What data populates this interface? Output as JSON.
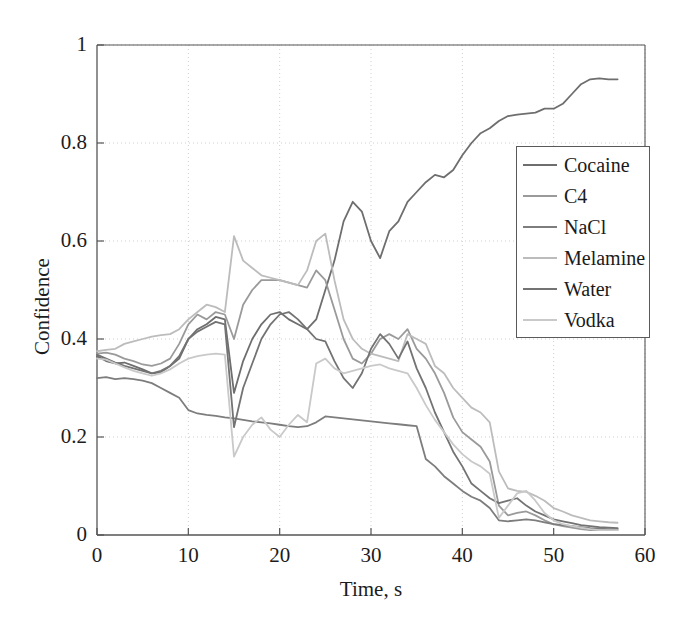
{
  "chart_data": {
    "type": "line",
    "title": "",
    "xlabel": "Time, s",
    "ylabel": "Confidence",
    "xlim": [
      0,
      60
    ],
    "ylim": [
      0,
      1
    ],
    "xticks": [
      "0",
      "10",
      "20",
      "30",
      "40",
      "50",
      "60"
    ],
    "xtick_values": [
      0,
      10,
      20,
      30,
      40,
      50,
      60
    ],
    "yticks": [
      "0",
      "0.2",
      "0.4",
      "0.6",
      "0.8",
      "1"
    ],
    "ytick_values": [
      0,
      0.2,
      0.4,
      0.6,
      0.8,
      1
    ],
    "grid": true,
    "grid_style": "dotted",
    "legend_position": "upper-right-inside",
    "x": [
      0,
      1,
      2,
      3,
      4,
      5,
      6,
      7,
      8,
      9,
      10,
      11,
      12,
      13,
      14,
      15,
      16,
      17,
      18,
      19,
      20,
      21,
      22,
      23,
      24,
      25,
      26,
      27,
      28,
      29,
      30,
      31,
      32,
      33,
      34,
      35,
      36,
      37,
      38,
      39,
      40,
      41,
      42,
      43,
      44,
      45,
      46,
      47,
      48,
      49,
      50,
      51,
      52,
      53,
      54,
      55,
      56,
      57
    ],
    "series": [
      {
        "name": "Cocaine",
        "color": "#6e6e6e",
        "values": [
          0.365,
          0.355,
          0.35,
          0.352,
          0.345,
          0.338,
          0.33,
          0.332,
          0.345,
          0.36,
          0.4,
          0.42,
          0.43,
          0.445,
          0.44,
          0.29,
          0.355,
          0.4,
          0.43,
          0.45,
          0.455,
          0.44,
          0.43,
          0.42,
          0.44,
          0.5,
          0.56,
          0.64,
          0.68,
          0.66,
          0.6,
          0.565,
          0.62,
          0.64,
          0.68,
          0.7,
          0.72,
          0.735,
          0.73,
          0.745,
          0.775,
          0.8,
          0.82,
          0.83,
          0.845,
          0.855,
          0.858,
          0.86,
          0.862,
          0.87,
          0.87,
          0.88,
          0.9,
          0.92,
          0.93,
          0.932,
          0.93,
          0.93
        ]
      },
      {
        "name": "C4",
        "color": "#9a9a9a",
        "values": [
          0.37,
          0.372,
          0.368,
          0.36,
          0.355,
          0.348,
          0.345,
          0.35,
          0.36,
          0.39,
          0.43,
          0.45,
          0.44,
          0.455,
          0.45,
          0.4,
          0.47,
          0.5,
          0.52,
          0.52,
          0.52,
          0.515,
          0.51,
          0.505,
          0.54,
          0.52,
          0.46,
          0.4,
          0.36,
          0.35,
          0.37,
          0.4,
          0.41,
          0.4,
          0.42,
          0.38,
          0.36,
          0.33,
          0.29,
          0.24,
          0.21,
          0.195,
          0.18,
          0.15,
          0.06,
          0.04,
          0.045,
          0.048,
          0.04,
          0.03,
          0.022,
          0.018,
          0.015,
          0.012,
          0.01,
          0.01,
          0.01,
          0.01
        ]
      },
      {
        "name": "NaCl",
        "color": "#7d7d7d",
        "values": [
          0.32,
          0.322,
          0.318,
          0.32,
          0.318,
          0.315,
          0.31,
          0.3,
          0.29,
          0.28,
          0.255,
          0.248,
          0.245,
          0.243,
          0.24,
          0.238,
          0.235,
          0.232,
          0.23,
          0.228,
          0.225,
          0.222,
          0.22,
          0.222,
          0.23,
          0.242,
          0.24,
          0.238,
          0.236,
          0.234,
          0.232,
          0.23,
          0.228,
          0.226,
          0.224,
          0.222,
          0.155,
          0.14,
          0.12,
          0.105,
          0.09,
          0.078,
          0.07,
          0.055,
          0.03,
          0.028,
          0.03,
          0.032,
          0.03,
          0.026,
          0.022,
          0.02,
          0.018,
          0.016,
          0.014,
          0.013,
          0.012,
          0.012
        ]
      },
      {
        "name": "Melamine",
        "color": "#bcbcbc",
        "values": [
          0.375,
          0.378,
          0.38,
          0.39,
          0.395,
          0.4,
          0.405,
          0.408,
          0.41,
          0.42,
          0.44,
          0.455,
          0.47,
          0.465,
          0.455,
          0.61,
          0.56,
          0.545,
          0.53,
          0.525,
          0.52,
          0.515,
          0.51,
          0.54,
          0.6,
          0.615,
          0.52,
          0.44,
          0.4,
          0.38,
          0.37,
          0.365,
          0.36,
          0.355,
          0.41,
          0.4,
          0.39,
          0.345,
          0.33,
          0.3,
          0.28,
          0.26,
          0.25,
          0.23,
          0.13,
          0.095,
          0.09,
          0.088,
          0.08,
          0.07,
          0.055,
          0.048,
          0.04,
          0.035,
          0.03,
          0.028,
          0.026,
          0.025
        ]
      },
      {
        "name": "Water",
        "color": "#737373",
        "values": [
          0.368,
          0.36,
          0.352,
          0.345,
          0.34,
          0.335,
          0.33,
          0.335,
          0.345,
          0.365,
          0.4,
          0.415,
          0.425,
          0.435,
          0.43,
          0.22,
          0.3,
          0.35,
          0.4,
          0.43,
          0.45,
          0.455,
          0.44,
          0.42,
          0.4,
          0.395,
          0.355,
          0.32,
          0.3,
          0.33,
          0.38,
          0.41,
          0.39,
          0.36,
          0.395,
          0.34,
          0.3,
          0.25,
          0.21,
          0.17,
          0.14,
          0.105,
          0.09,
          0.075,
          0.065,
          0.07,
          0.075,
          0.06,
          0.048,
          0.04,
          0.032,
          0.028,
          0.024,
          0.02,
          0.018,
          0.016,
          0.015,
          0.014
        ]
      },
      {
        "name": "Vodka",
        "color": "#c9c9c9",
        "values": [
          0.36,
          0.358,
          0.35,
          0.342,
          0.335,
          0.33,
          0.325,
          0.33,
          0.338,
          0.35,
          0.36,
          0.365,
          0.368,
          0.37,
          0.368,
          0.16,
          0.2,
          0.225,
          0.24,
          0.215,
          0.2,
          0.225,
          0.245,
          0.23,
          0.35,
          0.36,
          0.34,
          0.33,
          0.335,
          0.34,
          0.345,
          0.348,
          0.34,
          0.335,
          0.33,
          0.3,
          0.265,
          0.235,
          0.21,
          0.185,
          0.165,
          0.15,
          0.14,
          0.125,
          0.035,
          0.06,
          0.085,
          0.09,
          0.07,
          0.045,
          0.03,
          0.022,
          0.018,
          0.015,
          0.012,
          0.01,
          0.01,
          0.01
        ]
      }
    ]
  },
  "axes": {
    "x_title": "Time, s",
    "y_title": "Confidence"
  },
  "legend": {
    "entries": [
      {
        "label": "Cocaine"
      },
      {
        "label": "C4"
      },
      {
        "label": "NaCl"
      },
      {
        "label": "Melamine"
      },
      {
        "label": "Water"
      },
      {
        "label": "Vodka"
      }
    ]
  },
  "style": {
    "axis_color": "#555555",
    "grid_color": "#cfcfcf",
    "background": "#ffffff"
  }
}
